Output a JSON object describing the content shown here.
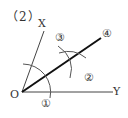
{
  "figure": {
    "part_label": "（2）",
    "points": {
      "O": "O",
      "X": "X",
      "Y": "Y"
    },
    "step_markers": {
      "step1": "①",
      "step2": "②",
      "step3": "③",
      "step4": "④"
    },
    "colors": {
      "line": "#333333",
      "bisector": "#111111",
      "background": "#ffffff"
    }
  }
}
